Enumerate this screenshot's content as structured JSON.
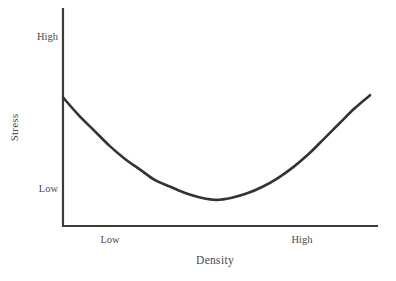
{
  "chart_data": {
    "type": "line",
    "title": "",
    "subtitle": "",
    "xlabel": "Density",
    "ylabel": "Stress",
    "x_tick_labels": [
      "Low",
      "High"
    ],
    "y_tick_labels": [
      "Low",
      "High"
    ],
    "x_tick_positions": [
      0.15,
      0.76
    ],
    "y_tick_positions": [
      0.16,
      0.86
    ],
    "xlim": [
      0,
      1
    ],
    "ylim": [
      0,
      1
    ],
    "grid": false,
    "legend": null,
    "legend_position": "none",
    "annotations": [],
    "series": [
      {
        "name": "Stress vs Density",
        "shape": "u-shaped parabola",
        "x": [
          0.0,
          0.05,
          0.1,
          0.15,
          0.2,
          0.25,
          0.3,
          0.35,
          0.4,
          0.45,
          0.5,
          0.55,
          0.6,
          0.65,
          0.7,
          0.75,
          0.8,
          0.85,
          0.9,
          0.95,
          1.0
        ],
        "y": [
          0.59,
          0.51,
          0.44,
          0.37,
          0.31,
          0.26,
          0.21,
          0.18,
          0.15,
          0.13,
          0.12,
          0.13,
          0.15,
          0.18,
          0.22,
          0.27,
          0.33,
          0.4,
          0.47,
          0.54,
          0.6
        ],
        "minimum": {
          "x": 0.46,
          "y": 0.12
        },
        "endpoints": {
          "left": {
            "x": 0.0,
            "y": 0.59
          },
          "right": {
            "x": 1.0,
            "y": 0.6
          }
        },
        "color": "#333333",
        "line_width": 2.6
      }
    ],
    "axes": {
      "spine_color": "#3c3c3c",
      "spine_width": 2.2,
      "spines_visible": [
        "left",
        "bottom"
      ],
      "tick_marks": false
    },
    "style": {
      "background": "#ffffff",
      "text_color": "#4a4a4a"
    }
  }
}
